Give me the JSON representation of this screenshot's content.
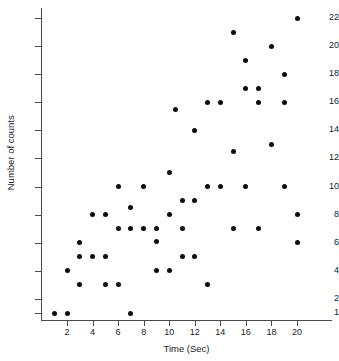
{
  "chart_data": {
    "type": "scatter",
    "title": "",
    "xlabel": "Time (Sec)",
    "ylabel": "Number of counts",
    "xlim": [
      0,
      21.3
    ],
    "ylim": [
      0,
      22.8
    ],
    "grid": false,
    "legend": null,
    "xticks": [
      2,
      4,
      6,
      8,
      10,
      12,
      14,
      16,
      18,
      20
    ],
    "xtick_labels": [
      "2",
      "4",
      "6",
      "8",
      "10",
      "12",
      "14",
      "16",
      "18",
      "20"
    ],
    "yticks": [
      1,
      2,
      4,
      6,
      8,
      10,
      12,
      14,
      16,
      18,
      20,
      22
    ],
    "ytick_labels": [
      "1",
      "2",
      "4",
      "6",
      "8",
      "10",
      "12",
      "14",
      "16",
      "18",
      "20",
      "22"
    ],
    "marker": "filled-circle",
    "marker_color": "#0d0d0d",
    "points": [
      {
        "x": 1,
        "y": 1
      },
      {
        "x": 2,
        "y": 1
      },
      {
        "x": 2,
        "y": 4
      },
      {
        "x": 3,
        "y": 3
      },
      {
        "x": 3,
        "y": 5
      },
      {
        "x": 3,
        "y": 6
      },
      {
        "x": 4,
        "y": 5
      },
      {
        "x": 4,
        "y": 8
      },
      {
        "x": 5,
        "y": 3
      },
      {
        "x": 5,
        "y": 5
      },
      {
        "x": 5,
        "y": 8
      },
      {
        "x": 6,
        "y": 3
      },
      {
        "x": 6,
        "y": 7
      },
      {
        "x": 6,
        "y": 10
      },
      {
        "x": 7,
        "y": 1
      },
      {
        "x": 7,
        "y": 7
      },
      {
        "x": 7,
        "y": 8.5
      },
      {
        "x": 8,
        "y": 7
      },
      {
        "x": 8,
        "y": 10
      },
      {
        "x": 9,
        "y": 4
      },
      {
        "x": 9,
        "y": 6.1
      },
      {
        "x": 9,
        "y": 7
      },
      {
        "x": 10,
        "y": 4
      },
      {
        "x": 10,
        "y": 8
      },
      {
        "x": 10,
        "y": 11
      },
      {
        "x": 10.5,
        "y": 15.5
      },
      {
        "x": 11,
        "y": 5
      },
      {
        "x": 11,
        "y": 7
      },
      {
        "x": 11,
        "y": 9
      },
      {
        "x": 12,
        "y": 5
      },
      {
        "x": 12,
        "y": 9
      },
      {
        "x": 12,
        "y": 14
      },
      {
        "x": 13,
        "y": 3
      },
      {
        "x": 13,
        "y": 10
      },
      {
        "x": 13,
        "y": 16
      },
      {
        "x": 14,
        "y": 10
      },
      {
        "x": 14,
        "y": 16
      },
      {
        "x": 15,
        "y": 7
      },
      {
        "x": 15,
        "y": 12.5
      },
      {
        "x": 15,
        "y": 21
      },
      {
        "x": 16,
        "y": 10
      },
      {
        "x": 16,
        "y": 17
      },
      {
        "x": 16,
        "y": 19
      },
      {
        "x": 17,
        "y": 7
      },
      {
        "x": 17,
        "y": 16
      },
      {
        "x": 17,
        "y": 17
      },
      {
        "x": 18,
        "y": 13
      },
      {
        "x": 18,
        "y": 20
      },
      {
        "x": 19,
        "y": 10
      },
      {
        "x": 19,
        "y": 16
      },
      {
        "x": 19,
        "y": 18
      },
      {
        "x": 20,
        "y": 6
      },
      {
        "x": 20,
        "y": 8
      },
      {
        "x": 20,
        "y": 22
      }
    ]
  }
}
